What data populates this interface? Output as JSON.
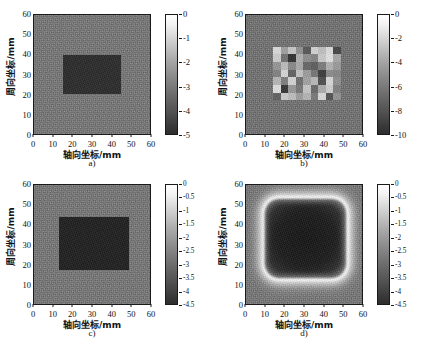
{
  "figure": {
    "background_color": "#ffffff",
    "map_background_gray": "#757575",
    "defect_dark_gray": "#2b2b2b"
  },
  "axes": {
    "x_label": "轴向坐标/mm",
    "y_label": "周向坐标/mm",
    "x_ticks": [
      "0",
      "10",
      "20",
      "30",
      "40",
      "50",
      "60"
    ],
    "y_ticks": [
      "0",
      "10",
      "20",
      "30",
      "40",
      "50",
      "60"
    ],
    "x_range": [
      0,
      60
    ],
    "y_range": [
      0,
      60
    ]
  },
  "panels": [
    {
      "id": "a",
      "caption": "a)",
      "colorbar": {
        "ticks": [
          "0",
          "-1",
          "-2",
          "-3",
          "-4",
          "-5"
        ],
        "min": -5,
        "max": 0
      }
    },
    {
      "id": "b",
      "caption": "b)",
      "colorbar": {
        "ticks": [
          "0",
          "-2",
          "-4",
          "-6",
          "-8",
          "-10"
        ],
        "min": -10,
        "max": 0
      }
    },
    {
      "id": "c",
      "caption": "c)",
      "colorbar": {
        "ticks": [
          "0",
          "-0.5",
          "-1",
          "-1.5",
          "-2",
          "-2.5",
          "-3",
          "-3.5",
          "-4",
          "-4.5"
        ],
        "min": -4.5,
        "max": 0
      }
    },
    {
      "id": "d",
      "caption": "d)",
      "colorbar": {
        "ticks": [
          "0",
          "-0.5",
          "-1",
          "-1.5",
          "-2",
          "-2.5",
          "-3",
          "-3.5",
          "-4",
          "-4.5"
        ],
        "min": -4.5,
        "max": 0
      }
    }
  ],
  "chart_data": [
    {
      "type": "heatmap",
      "panel": "a",
      "title": "a)",
      "xlabel": "轴向坐标/mm",
      "ylabel": "周向坐标/mm",
      "xlim": [
        0,
        60
      ],
      "ylim": [
        0,
        60
      ],
      "colorbar_label": "",
      "zlim": [
        -5,
        0
      ],
      "colormap": "gray",
      "background_value": -2.2,
      "regions": [
        {
          "shape": "rectangle",
          "x0": 15,
          "x1": 45,
          "y0": 20,
          "y1": 40,
          "value": -4.4
        }
      ]
    },
    {
      "type": "heatmap",
      "panel": "b",
      "title": "b)",
      "xlabel": "轴向坐标/mm",
      "ylabel": "周向坐标/mm",
      "xlim": [
        0,
        60
      ],
      "ylim": [
        0,
        60
      ],
      "zlim": [
        -10,
        0
      ],
      "colormap": "gray",
      "background_value": -4.5,
      "grid": {
        "x0": 14,
        "x1": 49,
        "y0": 17,
        "y1": 44,
        "cols": 9,
        "rows": 7,
        "values": [
          [
            -1.2,
            -3.9,
            -2.1,
            -4.6,
            -7.3,
            -1.6,
            -2.4,
            -1.1,
            -8.2
          ],
          [
            -1.8,
            -6.1,
            -9.1,
            -3.2,
            -4.8,
            -5.2,
            -2.0,
            -0.9,
            -3.6
          ],
          [
            -4.4,
            -2.6,
            -5.0,
            -3.5,
            -6.6,
            -7.0,
            -5.6,
            -3.1,
            -4.2
          ],
          [
            -5.3,
            -1.4,
            -6.8,
            -2.3,
            -4.1,
            -5.9,
            -8.6,
            -4.9,
            -5.1
          ],
          [
            -2.9,
            -5.5,
            -1.5,
            -6.2,
            -3.8,
            -2.7,
            -7.7,
            -1.3,
            -4.7
          ],
          [
            -1.0,
            -8.9,
            -4.3,
            -5.8,
            -2.2,
            -6.4,
            -3.3,
            -1.7,
            -5.4
          ],
          [
            -6.9,
            -1.9,
            -2.5,
            -4.0,
            -3.0,
            -5.7,
            -1.2,
            -7.5,
            -4.5
          ]
        ]
      }
    },
    {
      "type": "heatmap",
      "panel": "c",
      "title": "c)",
      "xlabel": "轴向坐标/mm",
      "ylabel": "周向坐标/mm",
      "xlim": [
        0,
        60
      ],
      "ylim": [
        0,
        60
      ],
      "zlim": [
        -4.5,
        0
      ],
      "colormap": "gray",
      "background_value": -2.0,
      "regions": [
        {
          "shape": "rectangle",
          "x0": 13,
          "x1": 49,
          "y0": 17,
          "y1": 44,
          "value": -4.3
        }
      ]
    },
    {
      "type": "heatmap",
      "panel": "d",
      "title": "d)",
      "xlabel": "轴向坐标/mm",
      "ylabel": "周向坐标/mm",
      "xlim": [
        0,
        60
      ],
      "ylim": [
        0,
        60
      ],
      "zlim": [
        -4.5,
        0
      ],
      "colormap": "gray",
      "background_value": -2.0,
      "regions": [
        {
          "shape": "rounded-rectangle-ring",
          "x0": 11,
          "x1": 51,
          "y0": 14,
          "y1": 47,
          "value": 0.0,
          "note": "bright halo edge"
        },
        {
          "shape": "rounded-rectangle-fill",
          "x0": 14,
          "x1": 48,
          "y0": 17,
          "y1": 44,
          "value": -4.2,
          "note": "blurred dark interior"
        }
      ]
    }
  ]
}
